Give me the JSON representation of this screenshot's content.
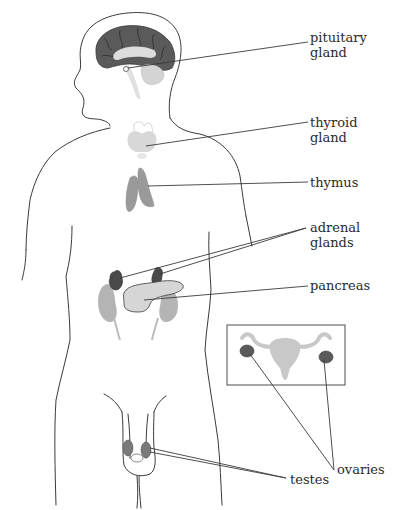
{
  "diagram": {
    "type": "anatomical-illustration",
    "colors": {
      "background": "#ffffff",
      "outline": "#3a3a3a",
      "brain_cortex": "#5a5a5a",
      "dark_gland": "#4a4a4a",
      "mid_gland": "#9a9a9a",
      "light_organ": "#d6d6d6",
      "kidney": "#b4b4b4",
      "inset_organ": "#c8c8c8"
    },
    "labels": {
      "pituitary": {
        "line1": "pituitary",
        "line2": "gland"
      },
      "thyroid": {
        "line1": "thyroid",
        "line2": "gland"
      },
      "thymus": {
        "line1": "thymus"
      },
      "adrenal": {
        "line1": "adrenal",
        "line2": "glands"
      },
      "pancreas": {
        "line1": "pancreas"
      },
      "ovaries": {
        "line1": "ovaries"
      },
      "testes": {
        "line1": "testes"
      }
    },
    "inset": {
      "description": "female reproductive system inset box"
    }
  }
}
